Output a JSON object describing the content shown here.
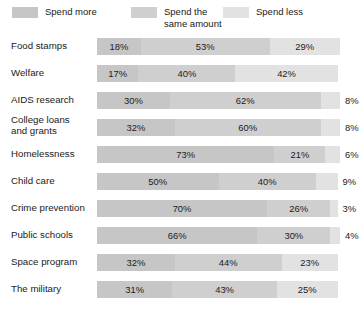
{
  "legend": {
    "items": [
      {
        "label": "Spend more",
        "color": "#c6c6c6"
      },
      {
        "label": "Spend the\nsame amount",
        "color": "#cfcfcf"
      },
      {
        "label": "Spend less",
        "color": "#e2e2e2"
      }
    ]
  },
  "chart_data": {
    "type": "bar",
    "subtype": "stacked-horizontal-100",
    "title": "",
    "xlabel": "",
    "ylabel": "",
    "xlim": [
      0,
      100
    ],
    "grid": false,
    "legend_position": "top",
    "value_suffix": "%",
    "categories": [
      "Food stamps",
      "Welfare",
      "AIDS research",
      "College loans\nand grants",
      "Homelessness",
      "Child care",
      "Crime prevention",
      "Public schools",
      "Space program",
      "The military"
    ],
    "series": [
      {
        "name": "Spend more",
        "color": "#c6c6c6",
        "values": [
          18,
          17,
          30,
          32,
          73,
          50,
          70,
          66,
          32,
          31
        ]
      },
      {
        "name": "Spend the same amount",
        "color": "#cfcfcf",
        "values": [
          53,
          40,
          62,
          60,
          21,
          40,
          26,
          30,
          44,
          43
        ]
      },
      {
        "name": "Spend less",
        "color": "#e2e2e2",
        "values": [
          29,
          42,
          8,
          8,
          6,
          9,
          3,
          4,
          23,
          25
        ]
      }
    ],
    "labels": [
      [
        "18%",
        "53%",
        "29%"
      ],
      [
        "17%",
        "40%",
        "42%"
      ],
      [
        "30%",
        "62%",
        "8%"
      ],
      [
        "32%",
        "60%",
        "8%"
      ],
      [
        "73%",
        "21%",
        "6%"
      ],
      [
        "50%",
        "40%",
        "9%"
      ],
      [
        "70%",
        "26%",
        "3%"
      ],
      [
        "66%",
        "30%",
        "4%"
      ],
      [
        "32%",
        "44%",
        "23%"
      ],
      [
        "31%",
        "43%",
        "25%"
      ]
    ]
  }
}
